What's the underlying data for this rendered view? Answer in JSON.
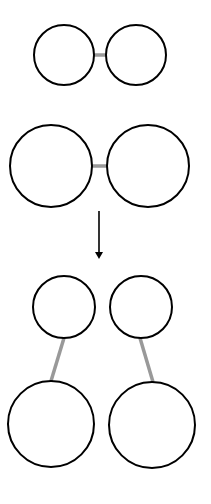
{
  "diagram": {
    "colors": {
      "background": "#ffffff",
      "circle_stroke": "#000000",
      "connector": "#999999",
      "arrow": "#000000"
    },
    "stages": [
      {
        "name": "pair-small",
        "circles": [
          {
            "cx": 64,
            "cy": 55,
            "r": 30
          },
          {
            "cx": 136,
            "cy": 55,
            "r": 30
          }
        ],
        "connector": {
          "x1": 94,
          "y1": 55,
          "x2": 106,
          "y2": 55
        }
      },
      {
        "name": "pair-large",
        "circles": [
          {
            "cx": 51,
            "cy": 166,
            "r": 41
          },
          {
            "cx": 148,
            "cy": 166,
            "r": 41
          }
        ],
        "connector": {
          "x1": 92,
          "y1": 166,
          "x2": 107,
          "y2": 166
        }
      },
      {
        "name": "separated-pairs",
        "circles": [
          {
            "cx": 64,
            "cy": 307,
            "r": 31
          },
          {
            "cx": 141,
            "cy": 307,
            "r": 31
          },
          {
            "cx": 51,
            "cy": 424,
            "r": 43
          },
          {
            "cx": 152,
            "cy": 425,
            "r": 43
          }
        ],
        "connectors": [
          {
            "x1": 64,
            "y1": 338,
            "x2": 51,
            "y2": 381
          },
          {
            "x1": 140,
            "y1": 338,
            "x2": 153,
            "y2": 382
          }
        ]
      }
    ],
    "arrow": {
      "x": 99,
      "y1": 211,
      "y2": 259,
      "direction": "down"
    }
  }
}
